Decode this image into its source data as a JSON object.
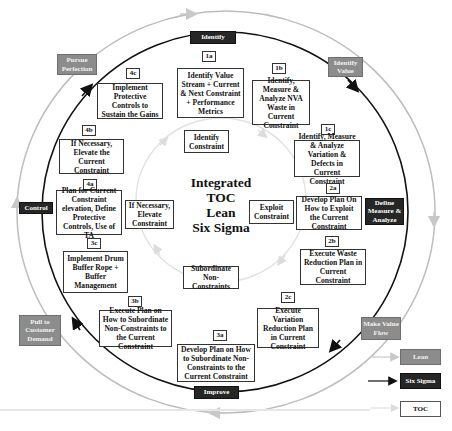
{
  "diagram": {
    "center_title": [
      "Integrated",
      "TOC",
      "Lean",
      "Six Sigma"
    ],
    "phases": {
      "identify": "Identify",
      "define_measure_analyze": "Define Measure & Analyze",
      "improve": "Improve",
      "control": "Control"
    },
    "lean_principles": {
      "identify_value": "Identify Value",
      "make_value_flow": "Make Value Flow",
      "pull_to_customer_demand": "Pull to Customer Demand",
      "pursue_perfection": "Pursue Perfection"
    },
    "toc_steps": {
      "identify": "Identify Constraint",
      "exploit": "Exploit Constraint",
      "subordinate": "Subordinate Non-Constraints",
      "elevate": "If Necessary, Elevate Constraint"
    },
    "steps": [
      {
        "id": "1a",
        "text": "Identify Value Stream + Current & Next Constraint + Performance Metrics"
      },
      {
        "id": "1b",
        "text": "Identify, Measure & Analyze NVA Waste in Current Constraint"
      },
      {
        "id": "1c",
        "text": "Identify, Measure & Analyze Variation & Defects in Current Constraint"
      },
      {
        "id": "2a",
        "text": "Develop Plan On How to Exploit the Current Constraint"
      },
      {
        "id": "2b",
        "text": "Execute Waste Reduction Plan in Current Constraint"
      },
      {
        "id": "2c",
        "text": "Execute Variation Reduction Plan in Current Constraint"
      },
      {
        "id": "3a",
        "text": "Develop Plan on How to Subordinate Non-Constraints to the Current Constraint"
      },
      {
        "id": "3b",
        "text": "Execute Plan on How to Subordinate Non-Constraints to the Current Constraint"
      },
      {
        "id": "3c",
        "text": "Implement Drum Buffer Rope + Buffer Management"
      },
      {
        "id": "4a",
        "text": "Plan for Current Constraint elevation, Define Protective Controls, Use of TA"
      },
      {
        "id": "4b",
        "text": "If Necessary, Elevate the Current Constraint"
      },
      {
        "id": "4c",
        "text": "Implement Protective Controls to Sustain the Gains"
      }
    ],
    "legend": [
      {
        "label": "Lean",
        "color": "#8c8c8c"
      },
      {
        "label": "Six Sigma",
        "color": "#262626"
      },
      {
        "label": "TOC",
        "color": "#ffffff"
      }
    ]
  }
}
